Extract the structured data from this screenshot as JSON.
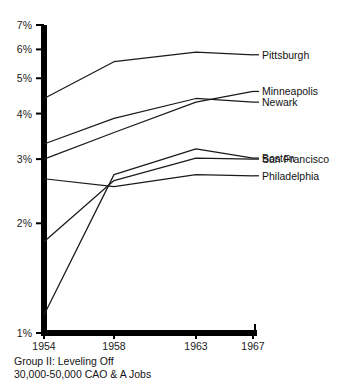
{
  "chart_data": {
    "type": "line",
    "title": "Group II: Leveling Off",
    "subtitle": "30,000-50,000 CAO & A Jobs",
    "xlabel": "",
    "ylabel": "",
    "yscale": "log",
    "ylim": [
      1,
      7
    ],
    "grid": false,
    "legend_position": "right-inline",
    "x": [
      "1954",
      "1958",
      "1963",
      "1967"
    ],
    "ytick_labels": [
      "1%",
      "2%",
      "3%",
      "4%",
      "5%",
      "6%",
      "7%"
    ],
    "ytick_values": [
      1,
      2,
      3,
      4,
      5,
      6,
      7
    ],
    "xtick_labels": [
      "1954",
      "1958",
      "1963",
      "1967"
    ],
    "series": [
      {
        "name": "Pittsburgh",
        "values": [
          4.4,
          5.55,
          5.9,
          5.8
        ]
      },
      {
        "name": "Minneapolis",
        "values": [
          3.0,
          3.55,
          4.3,
          4.6
        ]
      },
      {
        "name": "Newark",
        "values": [
          3.3,
          3.88,
          4.4,
          4.3
        ]
      },
      {
        "name": "Boston",
        "values": [
          1.12,
          2.72,
          3.2,
          3.02
        ]
      },
      {
        "name": "San Francisco",
        "values": [
          1.78,
          2.62,
          3.02,
          3.0
        ]
      },
      {
        "name": "Philadelphia",
        "values": [
          2.65,
          2.52,
          2.72,
          2.7
        ]
      }
    ],
    "series_labels": [
      {
        "name": "Pittsburgh"
      },
      {
        "name": "Minneapolis"
      },
      {
        "name": "Newark"
      },
      {
        "name": "Boston"
      },
      {
        "name": "San Francisco"
      },
      {
        "name": "Philadelphia"
      }
    ]
  },
  "axis": {
    "y_ticks": [
      {
        "label": "7%"
      },
      {
        "label": "6%"
      },
      {
        "label": "5%"
      },
      {
        "label": "4%"
      },
      {
        "label": "3%"
      },
      {
        "label": "2%"
      },
      {
        "label": "1%"
      }
    ],
    "x_ticks": [
      {
        "label": "1954"
      },
      {
        "label": "1958"
      },
      {
        "label": "1963"
      },
      {
        "label": "1967"
      }
    ]
  },
  "labels": {
    "pittsburgh": "Pittsburgh",
    "minneapolis": "Minneapolis",
    "newark": "Newark",
    "boston": "Boston",
    "san_francisco": "San Francisco",
    "philadelphia": "Philadelphia"
  },
  "caption": {
    "line1": "Group II: Leveling Off",
    "line2": "30,000-50,000 CAO & A Jobs"
  },
  "colors": {
    "axis": "#000000",
    "line": "#1a1a1a",
    "text": "#141414",
    "background": "#ffffff"
  }
}
